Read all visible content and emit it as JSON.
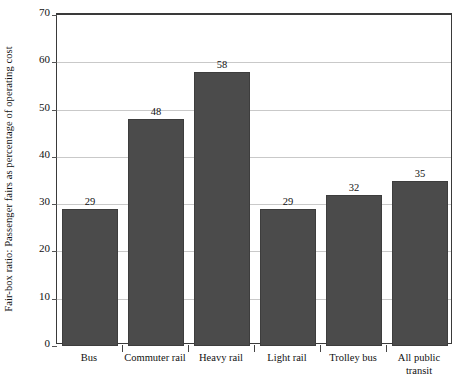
{
  "chart_data": {
    "type": "bar",
    "title": "",
    "subtitle": "",
    "xlabel": "",
    "ylabel": "Fair-box ratio: Passenger fairs as percentage of operating cost",
    "categories": [
      "Bus",
      "Commuter rail",
      "Heavy rail",
      "Light rail",
      "Trolley bus",
      "All public transit"
    ],
    "category_lines": [
      [
        "Bus"
      ],
      [
        "Commuter rail"
      ],
      [
        "Heavy rail"
      ],
      [
        "Light rail"
      ],
      [
        "Trolley bus"
      ],
      [
        "All public",
        "transit"
      ]
    ],
    "values": [
      29,
      48,
      58,
      29,
      32,
      35
    ],
    "value_labels": [
      "29",
      "48",
      "58",
      "29",
      "32",
      "35"
    ],
    "ylim": [
      0,
      70
    ],
    "yticks": [
      70,
      60,
      50,
      40,
      30,
      20,
      10,
      0
    ],
    "ytick_labels": [
      "70",
      "60",
      "50",
      "40",
      "30",
      "20",
      "10",
      "0"
    ],
    "grid": true,
    "grid_axis": "y",
    "legend": false,
    "legend_position": "none",
    "colors": {
      "bar_fill": "#4b4b4b",
      "bar_edge": "#3d3d3d",
      "gridline": "#c9c9c9",
      "axis": "#3a3a3a",
      "text": "#111111",
      "background": "#ffffff"
    }
  }
}
